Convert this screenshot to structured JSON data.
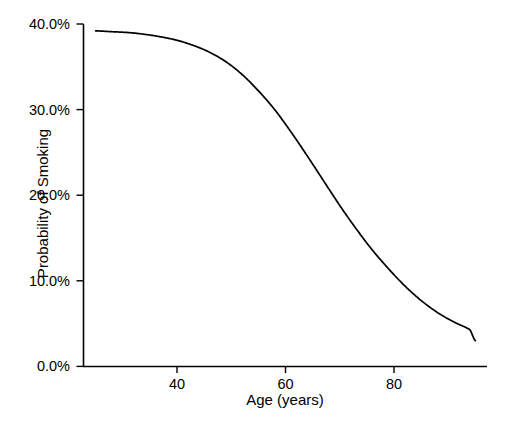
{
  "chart_data": {
    "type": "line",
    "title": "",
    "xlabel": "Age (years)",
    "ylabel": "Probability of Smoking",
    "xlim": [
      25,
      95
    ],
    "ylim": [
      0,
      0.4
    ],
    "grid": false,
    "legend": null,
    "x_tick_labels": [
      "40",
      "60",
      "80"
    ],
    "x_tick_values": [
      40,
      60,
      80
    ],
    "y_tick_labels": [
      "0.0%",
      "10.0%",
      "20.0%",
      "30.0%",
      "40.0%"
    ],
    "y_tick_values": [
      0.0,
      10.0,
      20.0,
      30.0,
      40.0
    ],
    "series": [
      {
        "name": "Probability of Smoking",
        "x": [
          25,
          28,
          31,
          34,
          37,
          40,
          43,
          46,
          49,
          52,
          55,
          58,
          61,
          64,
          67,
          70,
          73,
          76,
          79,
          82,
          85,
          88,
          91,
          94,
          95
        ],
        "values": [
          39.2,
          39.1,
          39.0,
          38.8,
          38.5,
          38.1,
          37.5,
          36.7,
          35.6,
          34.1,
          32.2,
          30.0,
          27.4,
          24.6,
          21.7,
          18.8,
          16.1,
          13.6,
          11.4,
          9.4,
          7.7,
          6.3,
          5.2,
          4.3,
          3.0
        ]
      }
    ],
    "line_color": "#000000",
    "axis_color": "#000000"
  },
  "axes": {
    "x_title": "Age (years)",
    "y_title": "Probability of Smoking"
  }
}
